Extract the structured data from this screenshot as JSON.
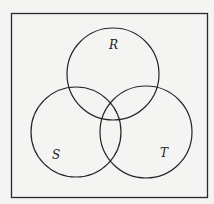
{
  "diagram": {
    "type": "venn",
    "sets": [
      {
        "name": "R",
        "label": "R",
        "cx": 113,
        "cy": 74,
        "r": 46,
        "label_x": 109,
        "label_y": 49
      },
      {
        "name": "S",
        "label": "S",
        "cx": 76,
        "cy": 132,
        "r": 45,
        "label_x": 52,
        "label_y": 159
      },
      {
        "name": "T",
        "label": "T",
        "cx": 146,
        "cy": 132,
        "r": 46,
        "label_x": 160,
        "label_y": 157
      }
    ],
    "universe_box": {
      "x": 11,
      "y": 13,
      "width": 196,
      "height": 184
    },
    "colors": {
      "stroke": "#262626",
      "background": "#f4f4f2"
    }
  }
}
